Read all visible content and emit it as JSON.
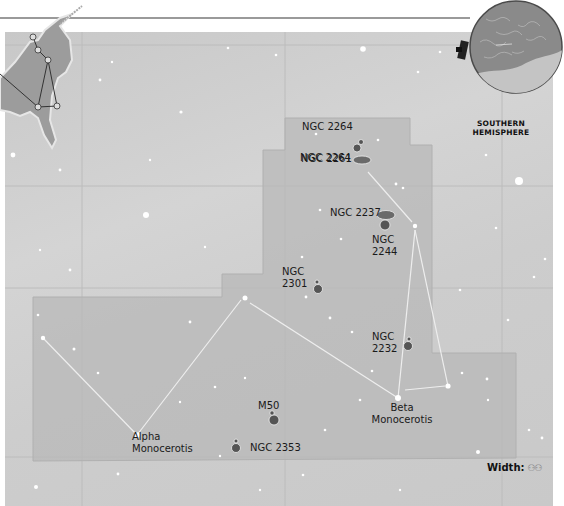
{
  "map": {
    "title_region": "Monoceros",
    "colors": {
      "sky": "#cecece",
      "constellation_area": "#b9b9b9",
      "grid_line": "#bdbdbd",
      "constellation_line": "#ececec",
      "star": "#ffffff",
      "label_text": "#1a1a1a"
    },
    "hemisphere_inset": {
      "label": "SOUTHERN\nHEMISPHERE"
    },
    "legend": {
      "width_label": "Width:",
      "width_icon": "binoculars-icon",
      "width_glyph": "♋♋"
    },
    "objects": [
      {
        "id": "ngc2264",
        "label": "NGC 2264"
      },
      {
        "id": "ngc2261",
        "label": "NGC 2261"
      },
      {
        "id": "ngc2237",
        "label": "NGC 2237"
      },
      {
        "id": "ngc2244",
        "label": "NGC\n2244"
      },
      {
        "id": "ngc2301",
        "label": "NGC\n2301"
      },
      {
        "id": "ngc2232",
        "label": "NGC\n2232"
      },
      {
        "id": "m50",
        "label": "M50"
      },
      {
        "id": "ngc2353",
        "label": "NGC 2353"
      }
    ],
    "stars": [
      {
        "id": "beta-monocerotis",
        "label": "Beta\nMonocerotis"
      },
      {
        "id": "alpha-monocerotis",
        "label": "Alpha\nMonocerotis"
      }
    ]
  }
}
